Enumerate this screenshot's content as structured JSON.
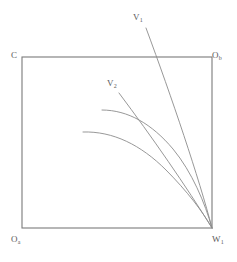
{
  "figure": {
    "type": "line-diagram",
    "background_color": "#ffffff",
    "box": {
      "x": 22,
      "y": 57,
      "width": 190,
      "height": 171,
      "stroke_color": "#7a7a7a",
      "stroke_width": 1.1
    },
    "curve_color": "#8c8c8c",
    "curve_width": 0.9,
    "labels": {
      "top_left": {
        "text": "C",
        "sub": ""
      },
      "top_right": {
        "text": "O",
        "sub": "b"
      },
      "bottom_left": {
        "text": "O",
        "sub": "a"
      },
      "bottom_right": {
        "text": "W",
        "sub": "1"
      },
      "line_v1": {
        "text": "V",
        "sub": "1"
      },
      "line_v2": {
        "text": "V",
        "sub": "2"
      }
    },
    "curves": [
      {
        "name": "line-v1",
        "kind": "straight",
        "points": [
          [
            146,
            28
          ],
          [
            212,
            228
          ]
        ]
      },
      {
        "name": "line-v2",
        "kind": "straight",
        "points": [
          [
            119,
            93
          ],
          [
            212,
            228
          ]
        ]
      },
      {
        "name": "arc-upper",
        "kind": "arc",
        "points": [
          [
            102,
            110
          ],
          [
            152,
            127
          ],
          [
            186,
            170
          ],
          [
            212,
            228
          ]
        ]
      },
      {
        "name": "arc-lower",
        "kind": "arc",
        "points": [
          [
            83,
            132
          ],
          [
            133,
            148
          ],
          [
            176,
            184
          ],
          [
            212,
            228
          ]
        ]
      }
    ],
    "convergence_point": [
      212,
      228
    ]
  }
}
